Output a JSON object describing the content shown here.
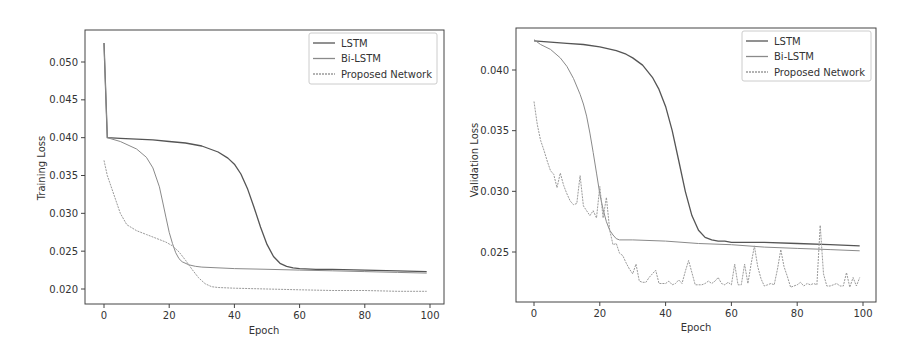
{
  "colors": {
    "lstm": "#555555",
    "bilstm": "#8a8a8a",
    "proposed": "#9a9a9a",
    "frame": "#444444",
    "legend_border": "#cccccc"
  },
  "chart_data": [
    {
      "type": "line",
      "title": "",
      "xlabel": "Epoch",
      "ylabel": "Training Loss",
      "xlim": [
        -5,
        104
      ],
      "ylim": [
        0.0182,
        0.0535
      ],
      "xticks": [
        "0",
        "20",
        "40",
        "60",
        "80",
        "100"
      ],
      "yticks": [
        "0.020",
        "0.025",
        "0.030",
        "0.035",
        "0.040",
        "0.045",
        "0.050"
      ],
      "legend_position": "upper right",
      "grid": false,
      "legend": [
        "LSTM",
        "Bi-LSTM",
        "Proposed Network"
      ],
      "series": [
        {
          "name": "LSTM",
          "x": [
            0,
            1,
            5,
            10,
            15,
            20,
            25,
            30,
            35,
            38,
            40,
            42,
            44,
            46,
            48,
            50,
            52,
            54,
            56,
            58,
            60,
            65,
            70,
            80,
            90,
            99
          ],
          "values": [
            0.0525,
            0.04,
            0.0399,
            0.0398,
            0.0397,
            0.0395,
            0.0393,
            0.0389,
            0.0381,
            0.0373,
            0.0365,
            0.0352,
            0.0333,
            0.0308,
            0.0282,
            0.0259,
            0.0243,
            0.0234,
            0.023,
            0.0228,
            0.0227,
            0.0226,
            0.0226,
            0.0225,
            0.0224,
            0.0223
          ]
        },
        {
          "name": "Bi-LSTM",
          "x": [
            0,
            1,
            5,
            10,
            13,
            15,
            17,
            18,
            19,
            20,
            21,
            22,
            23,
            24,
            26,
            28,
            30,
            40,
            50,
            60,
            70,
            80,
            90,
            99
          ],
          "values": [
            0.0525,
            0.04,
            0.0395,
            0.0385,
            0.0374,
            0.036,
            0.0335,
            0.0315,
            0.0295,
            0.0275,
            0.026,
            0.0248,
            0.024,
            0.0236,
            0.0232,
            0.023,
            0.0229,
            0.0227,
            0.0226,
            0.0225,
            0.0224,
            0.0223,
            0.0222,
            0.0221
          ]
        },
        {
          "name": "Proposed Network",
          "x": [
            0,
            1,
            3,
            5,
            7,
            10,
            13,
            16,
            19,
            21,
            23,
            25,
            27,
            29,
            31,
            33,
            35,
            40,
            50,
            60,
            70,
            80,
            90,
            99
          ],
          "values": [
            0.037,
            0.035,
            0.0325,
            0.03,
            0.0285,
            0.0277,
            0.0272,
            0.0267,
            0.0262,
            0.0257,
            0.0249,
            0.0238,
            0.0226,
            0.0215,
            0.0207,
            0.0203,
            0.0202,
            0.0201,
            0.02,
            0.0199,
            0.0198,
            0.0198,
            0.0197,
            0.0197
          ]
        }
      ]
    },
    {
      "type": "line",
      "title": "",
      "xlabel": "Epoch",
      "ylabel": "Validation Loss",
      "xlim": [
        -5,
        104
      ],
      "ylim": [
        0.0209,
        0.0436
      ],
      "xticks": [
        "0",
        "20",
        "40",
        "60",
        "80",
        "100"
      ],
      "yticks": [
        "0.025",
        "0.030",
        "0.035",
        "0.040"
      ],
      "legend_position": "upper right",
      "grid": false,
      "legend": [
        "LSTM",
        "Bi-LSTM",
        "Proposed Network"
      ],
      "series": [
        {
          "name": "LSTM",
          "x": [
            0,
            5,
            10,
            15,
            20,
            25,
            28,
            30,
            33,
            36,
            38,
            40,
            42,
            44,
            46,
            48,
            50,
            52,
            54,
            56,
            58,
            60,
            70,
            80,
            90,
            99
          ],
          "values": [
            0.0424,
            0.0423,
            0.0422,
            0.0421,
            0.0419,
            0.0416,
            0.0413,
            0.041,
            0.0404,
            0.0394,
            0.0384,
            0.037,
            0.035,
            0.0325,
            0.03,
            0.028,
            0.0268,
            0.0262,
            0.026,
            0.0259,
            0.0259,
            0.0258,
            0.0258,
            0.0257,
            0.0256,
            0.0255
          ]
        },
        {
          "name": "Bi-LSTM",
          "x": [
            0,
            2,
            5,
            8,
            10,
            12,
            14,
            15,
            16,
            17,
            18,
            19,
            20,
            21,
            22,
            23,
            24,
            25,
            26,
            30,
            40,
            50,
            60,
            70,
            80,
            90,
            99
          ],
          "values": [
            0.0425,
            0.0421,
            0.0417,
            0.041,
            0.0403,
            0.0393,
            0.038,
            0.0372,
            0.0362,
            0.0348,
            0.0332,
            0.0315,
            0.0298,
            0.0285,
            0.0275,
            0.0268,
            0.0264,
            0.0261,
            0.026,
            0.026,
            0.0259,
            0.0257,
            0.0256,
            0.0254,
            0.0253,
            0.0252,
            0.0251
          ]
        },
        {
          "name": "Proposed Network",
          "x": [
            0,
            1,
            2,
            3,
            4,
            5,
            6,
            7,
            8,
            9,
            10,
            11,
            12,
            13,
            14,
            15,
            16,
            17,
            18,
            19,
            20,
            21,
            22,
            23,
            24,
            25,
            26,
            27,
            28,
            29,
            30,
            31,
            32,
            33,
            34,
            35,
            36,
            37,
            38,
            39,
            40,
            41,
            42,
            43,
            44,
            45,
            46,
            47,
            48,
            49,
            50,
            51,
            52,
            53,
            54,
            55,
            56,
            57,
            58,
            59,
            60,
            61,
            62,
            63,
            64,
            65,
            66,
            67,
            68,
            69,
            70,
            71,
            72,
            73,
            74,
            75,
            76,
            77,
            78,
            79,
            80,
            81,
            82,
            83,
            84,
            85,
            86,
            87,
            88,
            89,
            90,
            91,
            92,
            93,
            94,
            95,
            96,
            97,
            98,
            99
          ],
          "values": [
            0.0374,
            0.0355,
            0.0342,
            0.0334,
            0.0325,
            0.0317,
            0.0314,
            0.0303,
            0.0315,
            0.0305,
            0.0298,
            0.0292,
            0.0289,
            0.029,
            0.0313,
            0.0288,
            0.0284,
            0.028,
            0.0284,
            0.0278,
            0.0304,
            0.0278,
            0.0295,
            0.0268,
            0.0256,
            0.0257,
            0.0249,
            0.0247,
            0.0241,
            0.0236,
            0.0232,
            0.024,
            0.0226,
            0.0225,
            0.0225,
            0.0229,
            0.0232,
            0.0235,
            0.0224,
            0.0224,
            0.0224,
            0.0226,
            0.0223,
            0.0224,
            0.0227,
            0.0224,
            0.0234,
            0.0243,
            0.0233,
            0.0223,
            0.0223,
            0.0223,
            0.0224,
            0.0226,
            0.0224,
            0.0226,
            0.0229,
            0.0224,
            0.0223,
            0.0225,
            0.0223,
            0.024,
            0.0223,
            0.0223,
            0.024,
            0.0224,
            0.024,
            0.0255,
            0.0238,
            0.0228,
            0.0222,
            0.0223,
            0.0224,
            0.0223,
            0.0236,
            0.0252,
            0.0238,
            0.023,
            0.0221,
            0.0222,
            0.0223,
            0.0225,
            0.0222,
            0.0224,
            0.0223,
            0.0224,
            0.0223,
            0.0272,
            0.0232,
            0.0222,
            0.0222,
            0.0223,
            0.0224,
            0.0222,
            0.0222,
            0.0233,
            0.0221,
            0.0229,
            0.0222,
            0.0229
          ]
        }
      ]
    }
  ]
}
